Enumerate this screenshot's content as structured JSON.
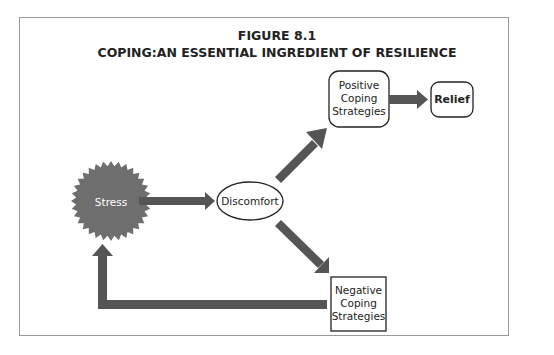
{
  "figure": {
    "number": "FIGURE 8.1",
    "title": "COPING:AN ESSENTIAL INGREDIENT OF RESILIENCE"
  },
  "nodes": {
    "stress": {
      "label": "Stress",
      "shape": "starburst",
      "fill": "#6e6e6e",
      "text_color": "#ffffff"
    },
    "discomfort": {
      "label": "Discomfort",
      "shape": "ellipse"
    },
    "positive": {
      "label": "Positive Coping Strategies",
      "lines": [
        "Positive",
        "Coping",
        "Strategies"
      ],
      "shape": "rounded-rect"
    },
    "relief": {
      "label": "Relief",
      "shape": "rounded-rect",
      "bold": true
    },
    "negative": {
      "label": "Negative Coping Strategies",
      "lines": [
        "Negative",
        "Coping",
        "Strategies"
      ],
      "shape": "rect"
    }
  },
  "edges": [
    {
      "from": "Stress",
      "to": "Discomfort"
    },
    {
      "from": "Discomfort",
      "to": "Positive Coping Strategies"
    },
    {
      "from": "Positive Coping Strategies",
      "to": "Relief"
    },
    {
      "from": "Discomfort",
      "to": "Negative Coping Strategies"
    },
    {
      "from": "Negative Coping Strategies",
      "to": "Stress"
    }
  ],
  "colors": {
    "arrow": "#555555",
    "stress_fill": "#6e6e6e",
    "frame": "#9a9a9a"
  }
}
